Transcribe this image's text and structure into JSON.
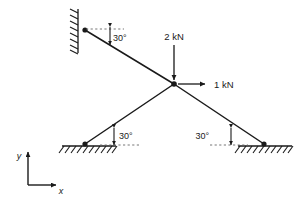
{
  "figure": {
    "background_color": "#ffffff",
    "line_color": "#1a1a1a",
    "reference_line_color": "#666666"
  },
  "joint": {
    "name": "central-joint",
    "x": 174,
    "y": 84
  },
  "supports": [
    {
      "id": "wall-support",
      "type": "fixed-wall",
      "orientation": "vertical",
      "pin_x": 85,
      "pin_y": 30,
      "wall_x": 78,
      "wall_top": 10,
      "wall_bottom": 52
    },
    {
      "id": "left-ground-support",
      "type": "ground",
      "orientation": "horizontal",
      "pin_x": 85,
      "pin_y": 144,
      "ground_left": 62,
      "ground_right": 116
    },
    {
      "id": "right-ground-support",
      "type": "ground",
      "orientation": "horizontal",
      "pin_x": 264,
      "pin_y": 144,
      "ground_left": 238,
      "ground_right": 292
    }
  ],
  "members": [
    {
      "id": "member-upper-left",
      "from": "wall-support",
      "to": "joint",
      "x1": 85,
      "y1": 30,
      "x2": 174,
      "y2": 84
    },
    {
      "id": "member-lower-left",
      "from": "left-ground-support",
      "to": "joint",
      "x1": 85,
      "y1": 144,
      "x2": 174,
      "y2": 84
    },
    {
      "id": "member-lower-right",
      "from": "right-ground-support",
      "to": "joint",
      "x1": 264,
      "y1": 144,
      "x2": 174,
      "y2": 84
    }
  ],
  "angles": [
    {
      "id": "angle-upper-left",
      "label": "30°",
      "value": 30,
      "unit": "degrees",
      "label_x": 113,
      "label_y": 38
    },
    {
      "id": "angle-lower-left",
      "label": "30°",
      "value": 30,
      "unit": "degrees",
      "label_x": 117,
      "label_y": 136
    },
    {
      "id": "angle-lower-right",
      "label": "30°",
      "value": 30,
      "unit": "degrees",
      "label_x": 212,
      "label_y": 136
    }
  ],
  "forces": [
    {
      "id": "force-vertical",
      "label": "2 kN",
      "magnitude": 2,
      "unit": "kN",
      "direction": "down",
      "tail_x": 174,
      "tail_y": 45,
      "head_x": 174,
      "head_y": 80,
      "label_x": 174,
      "label_y": 38
    },
    {
      "id": "force-horizontal",
      "label": "1 kN",
      "magnitude": 1,
      "unit": "kN",
      "direction": "right",
      "tail_x": 178,
      "tail_y": 84,
      "head_x": 211,
      "head_y": 84,
      "label_x": 218,
      "label_y": 88
    }
  ],
  "axes": {
    "id": "coordinate-axes",
    "origin_x": 28,
    "origin_y": 185,
    "y_label": "y",
    "y_label_x": 18,
    "y_label_y": 156,
    "y_tip_y": 150,
    "x_label": "x",
    "x_label_x": 62,
    "x_label_y": 196,
    "x_tip_x": 58
  }
}
